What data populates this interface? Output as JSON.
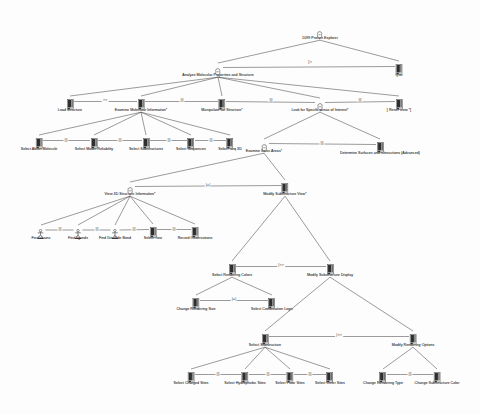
{
  "diagram": {
    "title": "1099 Protein Explorer",
    "type": "ConcurTaskTrees task model",
    "icon_legend": {
      "abstract": "abstract-task-icon",
      "interaction": "interaction-task-icon",
      "user": "user-task-icon"
    }
  },
  "nodes": [
    {
      "id": "root",
      "label": "1099 Protein Explorer",
      "icon": "abstract",
      "x": 320,
      "y": 26,
      "label_dy": 11
    },
    {
      "id": "analyze",
      "label": "Analyze Molecular Properties and Structure",
      "icon": "abstract",
      "x": 218,
      "y": 63,
      "label_dy": 11
    },
    {
      "id": "quit",
      "label": "Quit",
      "icon": "interaction",
      "x": 399,
      "y": 61,
      "label_dy": 13
    },
    {
      "id": "load",
      "label": "Load Structure",
      "icon": "interaction",
      "x": 70,
      "y": 96,
      "label_dy": 13
    },
    {
      "id": "examineinfo",
      "label": "Examine Molecular Information*",
      "icon": "interaction",
      "x": 141,
      "y": 96,
      "label_dy": 13
    },
    {
      "id": "manipulate",
      "label": "Manipulate 3D Structure*",
      "icon": "interaction",
      "x": 222,
      "y": 96,
      "label_dy": 13
    },
    {
      "id": "lookfor",
      "label": "Look for Specific Areas of Interest*",
      "icon": "abstract",
      "x": 320,
      "y": 98,
      "label_dy": 11
    },
    {
      "id": "reset",
      "label": "[ Reset View *]",
      "icon": "interaction",
      "x": 399,
      "y": 96,
      "label_dy": 13
    },
    {
      "id": "about",
      "label": "Select About Molecule",
      "icon": "interaction",
      "x": 39,
      "y": 135,
      "label_dy": 13
    },
    {
      "id": "reliability",
      "label": "Select Model Reliability",
      "icon": "interaction",
      "x": 94,
      "y": 135,
      "label_dy": 13
    },
    {
      "id": "substructures",
      "label": "Select Substructures",
      "icon": "interaction",
      "x": 146,
      "y": 135,
      "label_dy": 13
    },
    {
      "id": "sequences",
      "label": "Select Sequences",
      "icon": "interaction",
      "x": 191,
      "y": 135,
      "label_dy": 13
    },
    {
      "id": "seq3d",
      "label": "Select Seq 3D",
      "icon": "interaction",
      "x": 230,
      "y": 135,
      "label_dy": 13
    },
    {
      "id": "examinebasic",
      "label": "Examine Basic Areas*",
      "icon": "abstract",
      "x": 264,
      "y": 139,
      "label_dy": 11
    },
    {
      "id": "determine",
      "label": "Determine Surfaces and Interactions (Advanced)",
      "icon": "interaction",
      "x": 380,
      "y": 139,
      "label_dy": 13
    },
    {
      "id": "view3d",
      "label": "View 3D Structure Information*",
      "icon": "abstract",
      "x": 130,
      "y": 182,
      "label_dy": 11
    },
    {
      "id": "modifyview",
      "label": "Modify Substructure View*",
      "icon": "interaction",
      "x": 285,
      "y": 180,
      "label_dy": 13
    },
    {
      "id": "findchains",
      "label": "Find chains",
      "icon": "user",
      "x": 41,
      "y": 225,
      "label_dy": 12
    },
    {
      "id": "findligands",
      "label": "Find ligands",
      "icon": "user",
      "x": 78,
      "y": 225,
      "label_dy": 12
    },
    {
      "id": "finddisulfide",
      "label": "Find Disulfide Bond",
      "icon": "user",
      "x": 115,
      "y": 225,
      "label_dy": 12
    },
    {
      "id": "selecttour",
      "label": "Select Tour",
      "icon": "interaction",
      "x": 153,
      "y": 224,
      "label_dy": 13
    },
    {
      "id": "recordobs",
      "label": "Record Observations",
      "icon": "interaction",
      "x": 195,
      "y": 224,
      "label_dy": 13
    },
    {
      "id": "renderingcolors",
      "label": "Select Rendering Colors",
      "icon": "interaction",
      "x": 232,
      "y": 261,
      "label_dy": 13
    },
    {
      "id": "modifydisplay",
      "label": "Modify Substructure Display",
      "icon": "interaction",
      "x": 330,
      "y": 261,
      "label_dy": 13
    },
    {
      "id": "renderingsize",
      "label": "Change Rendering Size",
      "icon": "interaction",
      "x": 196,
      "y": 295,
      "label_dy": 13
    },
    {
      "id": "combinatorial",
      "label": "Select Combination Logic",
      "icon": "interaction",
      "x": 272,
      "y": 295,
      "label_dy": 13
    },
    {
      "id": "selectsubstructure",
      "label": "Select Substructure",
      "icon": "interaction",
      "x": 265,
      "y": 331,
      "label_dy": 13
    },
    {
      "id": "renderingoptions",
      "label": "Modify Rendering Options",
      "icon": "interaction",
      "x": 413,
      "y": 331,
      "label_dy": 13
    },
    {
      "id": "charged",
      "label": "Select Charged Sites",
      "icon": "interaction",
      "x": 191,
      "y": 369,
      "label_dy": 13
    },
    {
      "id": "hydrophobic",
      "label": "Select Hydrophobic Sites",
      "icon": "interaction",
      "x": 245,
      "y": 369,
      "label_dy": 13
    },
    {
      "id": "polar",
      "label": "Select Polar Sites",
      "icon": "interaction",
      "x": 290,
      "y": 369,
      "label_dy": 13
    },
    {
      "id": "other",
      "label": "Select Other Sites",
      "icon": "interaction",
      "x": 330,
      "y": 369,
      "label_dy": 13
    },
    {
      "id": "renderingtype",
      "label": "Change Rendering Type",
      "icon": "interaction",
      "x": 383,
      "y": 369,
      "label_dy": 13
    },
    {
      "id": "substructcolor",
      "label": "Change Substructure Color",
      "icon": "interaction",
      "x": 437,
      "y": 369,
      "label_dy": 13
    }
  ],
  "links": [
    {
      "from": "root",
      "to": "analyze",
      "kind": "tree"
    },
    {
      "from": "root",
      "to": "quit",
      "kind": "tree"
    },
    {
      "from": "analyze",
      "to": "load",
      "kind": "tree"
    },
    {
      "from": "analyze",
      "to": "examineinfo",
      "kind": "tree"
    },
    {
      "from": "analyze",
      "to": "manipulate",
      "kind": "tree"
    },
    {
      "from": "analyze",
      "to": "lookfor",
      "kind": "tree"
    },
    {
      "from": "analyze",
      "to": "reset",
      "kind": "tree"
    },
    {
      "from": "examineinfo",
      "to": "about",
      "kind": "tree"
    },
    {
      "from": "examineinfo",
      "to": "reliability",
      "kind": "tree"
    },
    {
      "from": "examineinfo",
      "to": "substructures",
      "kind": "tree"
    },
    {
      "from": "examineinfo",
      "to": "sequences",
      "kind": "tree"
    },
    {
      "from": "examineinfo",
      "to": "seq3d",
      "kind": "tree"
    },
    {
      "from": "lookfor",
      "to": "examinebasic",
      "kind": "tree"
    },
    {
      "from": "lookfor",
      "to": "determine",
      "kind": "tree"
    },
    {
      "from": "examinebasic",
      "to": "view3d",
      "kind": "tree"
    },
    {
      "from": "examinebasic",
      "to": "modifyview",
      "kind": "tree"
    },
    {
      "from": "view3d",
      "to": "findchains",
      "kind": "tree"
    },
    {
      "from": "view3d",
      "to": "findligands",
      "kind": "tree"
    },
    {
      "from": "view3d",
      "to": "finddisulfide",
      "kind": "tree"
    },
    {
      "from": "view3d",
      "to": "selecttour",
      "kind": "tree"
    },
    {
      "from": "view3d",
      "to": "recordobs",
      "kind": "tree"
    },
    {
      "from": "modifyview",
      "to": "renderingcolors",
      "kind": "tree"
    },
    {
      "from": "modifyview",
      "to": "modifydisplay",
      "kind": "tree"
    },
    {
      "from": "renderingcolors",
      "to": "renderingsize",
      "kind": "tree"
    },
    {
      "from": "renderingcolors",
      "to": "combinatorial",
      "kind": "tree"
    },
    {
      "from": "modifydisplay",
      "to": "selectsubstructure",
      "kind": "tree"
    },
    {
      "from": "modifydisplay",
      "to": "renderingoptions",
      "kind": "tree"
    },
    {
      "from": "selectsubstructure",
      "to": "charged",
      "kind": "tree"
    },
    {
      "from": "selectsubstructure",
      "to": "hydrophobic",
      "kind": "tree"
    },
    {
      "from": "selectsubstructure",
      "to": "polar",
      "kind": "tree"
    },
    {
      "from": "selectsubstructure",
      "to": "other",
      "kind": "tree"
    },
    {
      "from": "renderingoptions",
      "to": "renderingtype",
      "kind": "tree"
    },
    {
      "from": "renderingoptions",
      "to": "substructcolor",
      "kind": "tree"
    }
  ],
  "operators": [
    {
      "from": "analyze",
      "to": "quit",
      "label": "[>",
      "x": 310,
      "y": 62
    },
    {
      "from": "load",
      "to": "examineinfo",
      "label": ">>",
      "x": 105,
      "y": 100
    },
    {
      "from": "examineinfo",
      "to": "manipulate",
      "label": "|||",
      "x": 182,
      "y": 100
    },
    {
      "from": "manipulate",
      "to": "lookfor",
      "label": "|||",
      "x": 271,
      "y": 100
    },
    {
      "from": "lookfor",
      "to": "reset",
      "label": "|||",
      "x": 360,
      "y": 100
    },
    {
      "from": "about",
      "to": "reliability",
      "label": "|||",
      "x": 66,
      "y": 140
    },
    {
      "from": "reliability",
      "to": "substructures",
      "label": "|||",
      "x": 120,
      "y": 140
    },
    {
      "from": "substructures",
      "to": "sequences",
      "label": "|||",
      "x": 169,
      "y": 140
    },
    {
      "from": "sequences",
      "to": "seq3d",
      "label": "|||",
      "x": 211,
      "y": 140
    },
    {
      "from": "examinebasic",
      "to": "determine",
      "label": "|||",
      "x": 322,
      "y": 143
    },
    {
      "from": "view3d",
      "to": "modifyview",
      "label": "|=|",
      "x": 208,
      "y": 185
    },
    {
      "from": "findchains",
      "to": "findligands",
      "label": "|||",
      "x": 60,
      "y": 229
    },
    {
      "from": "findligands",
      "to": "finddisulfide",
      "label": "|||",
      "x": 97,
      "y": 229
    },
    {
      "from": "finddisulfide",
      "to": "selecttour",
      "label": "|||",
      "x": 134,
      "y": 229
    },
    {
      "from": "selecttour",
      "to": "recordobs",
      "label": "|||",
      "x": 174,
      "y": 229
    },
    {
      "from": "renderingcolors",
      "to": "modifydisplay",
      "label": "|>>",
      "x": 281,
      "y": 265
    },
    {
      "from": "renderingsize",
      "to": "combinatorial",
      "label": "|=|",
      "x": 234,
      "y": 299
    },
    {
      "from": "selectsubstructure",
      "to": "renderingoptions",
      "label": "|>>",
      "x": 339,
      "y": 335
    },
    {
      "from": "charged",
      "to": "hydrophobic",
      "label": "|||",
      "x": 218,
      "y": 374
    },
    {
      "from": "hydrophobic",
      "to": "polar",
      "label": "|||",
      "x": 268,
      "y": 374
    },
    {
      "from": "polar",
      "to": "other",
      "label": "|||",
      "x": 310,
      "y": 374
    },
    {
      "from": "renderingtype",
      "to": "substructcolor",
      "label": "|||",
      "x": 410,
      "y": 374
    }
  ],
  "colors": {
    "line": "#4a4a4a",
    "text": "#3a3a3a",
    "icon_dark": "#2e2e2e",
    "icon_light": "#c9c9c9",
    "background": "#fdfdfd"
  }
}
